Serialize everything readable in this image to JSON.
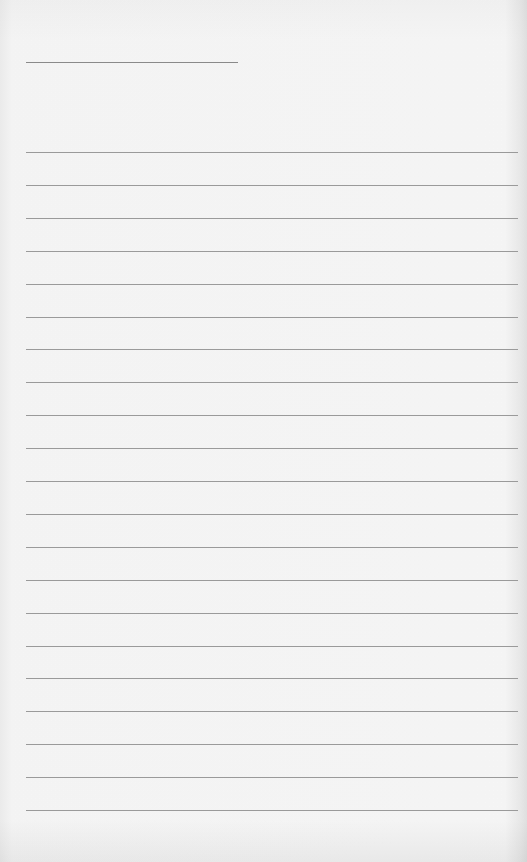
{
  "page": {
    "type": "lined-paper",
    "background_color": "#fafafa",
    "line_color": "#9a9a9a",
    "header_line": {
      "x": 26,
      "y": 62,
      "length": 212
    },
    "ruled_lines": {
      "count": 21,
      "first_y": 152,
      "spacing": 32.9,
      "x": 26,
      "length": 492
    }
  }
}
